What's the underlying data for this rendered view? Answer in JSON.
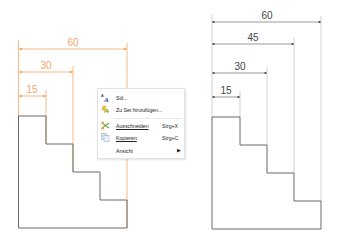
{
  "colors": {
    "selected_dim": "#f2a56b",
    "dim": "#555555",
    "outline": "#6a6a6a",
    "extension_right": "#bdbdbd"
  },
  "left_drawing": {
    "state": "selected",
    "dimensions": [
      {
        "label": "60",
        "y": 49,
        "x1": 18,
        "x2": 127
      },
      {
        "label": "30",
        "y": 72,
        "x1": 18,
        "x2": 73
      },
      {
        "label": "15",
        "y": 96,
        "x1": 18,
        "x2": 46
      }
    ]
  },
  "right_drawing": {
    "state": "normal",
    "dimensions": [
      {
        "label": "60",
        "y": 22,
        "x1": 212,
        "x2": 321
      },
      {
        "label": "45",
        "y": 44,
        "x1": 212,
        "x2": 294
      },
      {
        "label": "30",
        "y": 73,
        "x1": 212,
        "x2": 267
      },
      {
        "label": "15",
        "y": 97,
        "x1": 212,
        "x2": 240
      }
    ]
  },
  "context_menu": {
    "items": [
      {
        "icon": "text-style-icon",
        "label": "Stil...",
        "shortcut": ""
      },
      {
        "icon": "add-to-set-icon",
        "label": "Zu Set hinzufügen...",
        "shortcut": ""
      },
      {
        "icon": "cut-icon",
        "label": "Ausschneiden",
        "shortcut": "Strg+X"
      },
      {
        "icon": "copy-icon",
        "label": "Kopieren",
        "shortcut": "Strg+C"
      },
      {
        "icon": "",
        "label": "Ansicht",
        "shortcut": "",
        "submenu_arrow": "▶"
      }
    ]
  }
}
